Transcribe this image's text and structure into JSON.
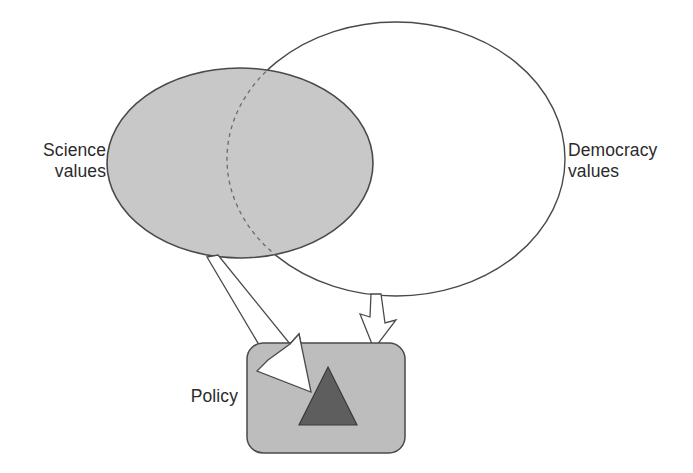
{
  "diagram": {
    "type": "venn-flow-diagram",
    "background_color": "#ffffff",
    "labels": {
      "science": "Science\nvalues",
      "democracy": "Democracy\nvalues",
      "policy": "Policy"
    },
    "shapes": {
      "science_ellipse": {
        "name": "Science values",
        "fill": "#c8c8c8",
        "stroke": "#4a4a4a",
        "cx": 240,
        "cy": 163,
        "rx": 133,
        "ry": 95
      },
      "democracy_ellipse": {
        "name": "Democracy values",
        "fill": "#ffffff",
        "stroke": "#4a4a4a",
        "cx": 396,
        "cy": 159,
        "rx": 169,
        "ry": 137
      },
      "policy_box": {
        "name": "Policy",
        "fill": "#bdbdbd",
        "stroke": "#4a4a4a",
        "x": 247,
        "y": 343,
        "width": 158,
        "height": 110,
        "corner_radius": 16
      },
      "policy_triangle": {
        "name": "Policy core",
        "fill": "#5e5e5e",
        "stroke": "#3a3a3a",
        "apex_x": 328,
        "apex_y": 367,
        "base_left_x": 299,
        "base_right_x": 357,
        "base_y": 425
      }
    },
    "arrows": [
      {
        "name": "science-to-policy-arrow",
        "from": "Science values",
        "to": "Policy",
        "style": "hollow-block",
        "fill": "#ffffff",
        "stroke": "#4a4a4a"
      },
      {
        "name": "democracy-to-policy-arrow",
        "from": "Democracy values",
        "to": "Policy",
        "style": "hollow-block",
        "fill": "#ffffff",
        "stroke": "#4a4a4a"
      }
    ],
    "overlap_boundary": {
      "name": "democracy-ellipse-overlap-edge",
      "style": "dashed",
      "stroke": "#6a6a6a"
    }
  }
}
